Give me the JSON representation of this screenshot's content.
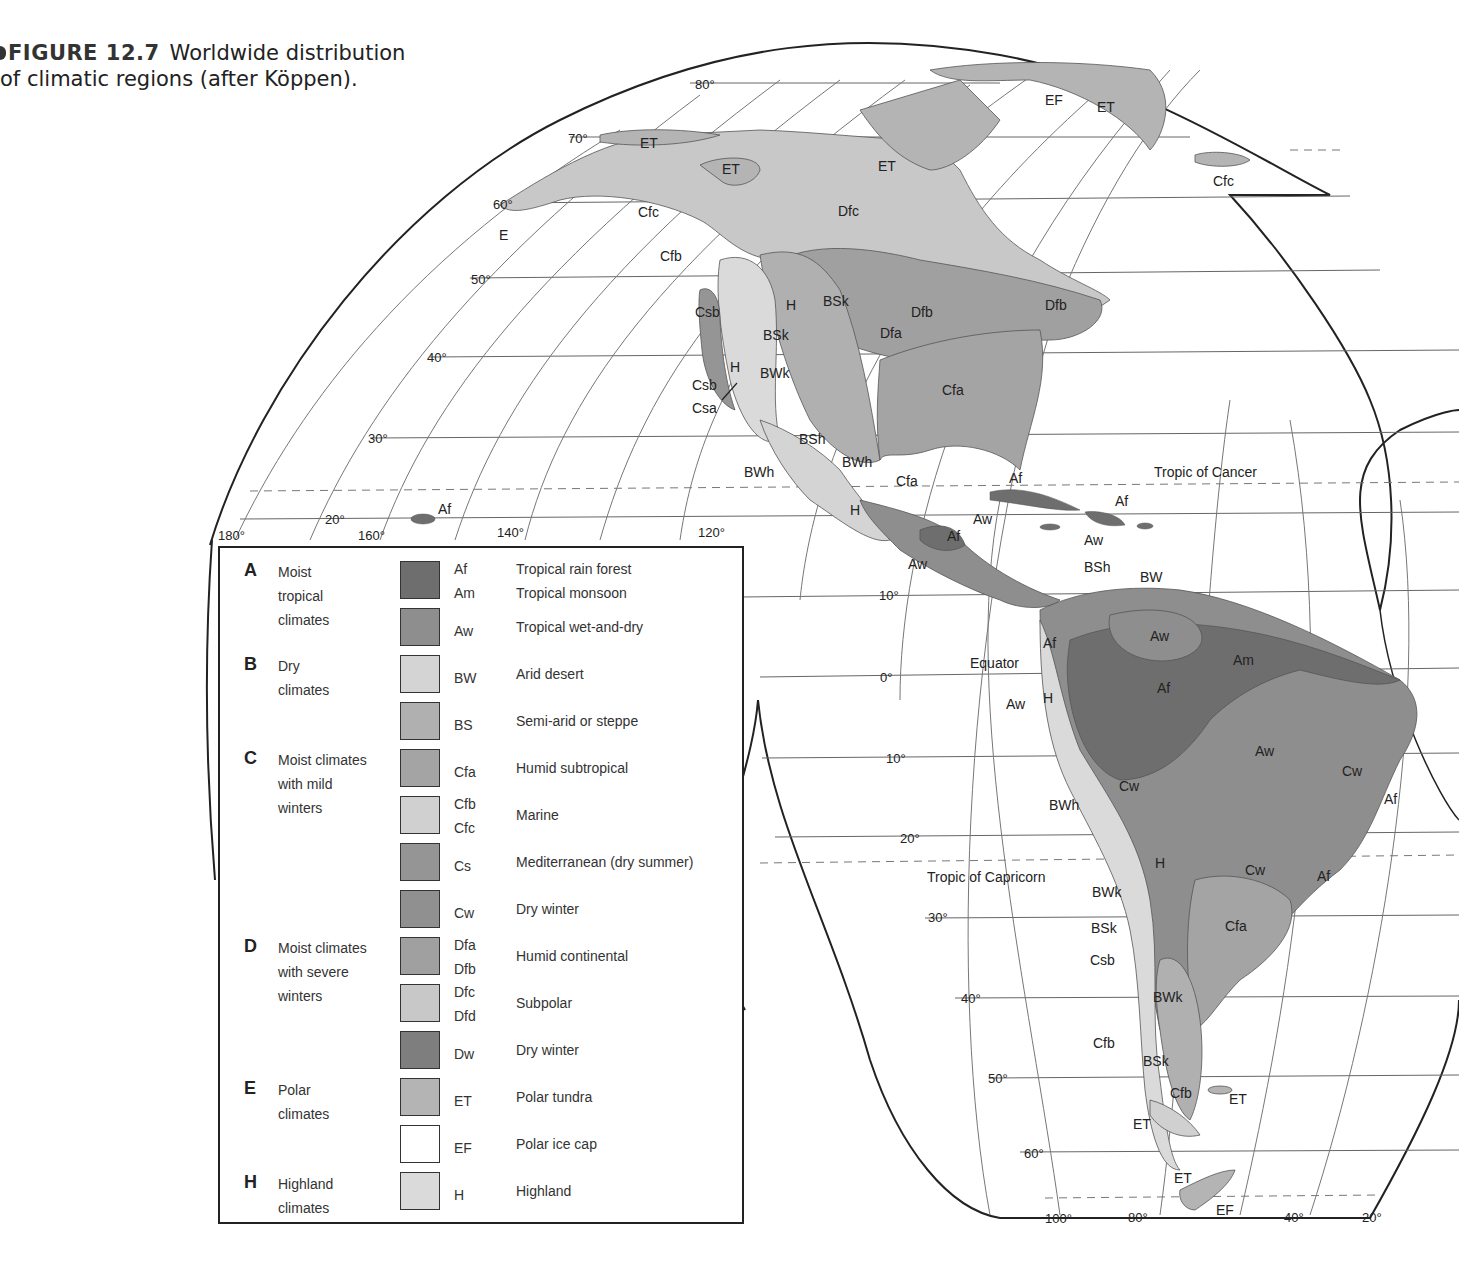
{
  "caption": {
    "figure_label": "FIGURE 12.7",
    "text_line1": "Worldwide distribution",
    "text_line2": "of climatic regions (after Köppen)."
  },
  "map": {
    "latitude_labels": [
      "80°",
      "70°",
      "60°",
      "50°",
      "40°",
      "30°",
      "20°",
      "10°",
      "0°",
      "10°",
      "20°",
      "30°",
      "40°",
      "50°",
      "60°"
    ],
    "longitude_labels_top": [
      "180°",
      "160°",
      "140°",
      "120°"
    ],
    "longitude_labels_bottom": [
      "100°",
      "80°",
      "40°",
      "20°"
    ],
    "reference_lines": {
      "tropic_cancer": "Tropic of Cancer",
      "equator": "Equator",
      "tropic_capricorn": "Tropic of Capricorn"
    },
    "region_labels": {
      "alaska_et": "ET",
      "canada_et1": "ET",
      "canada_et2": "ET",
      "greenland_ef": "EF",
      "greenland_et": "ET",
      "iceland_cfc": "Cfc",
      "alaska_cfc": "Cfc",
      "bc_cfb": "Cfb",
      "dfc": "Dfc",
      "e_aleut": "E",
      "csb1": "Csb",
      "h1": "H",
      "bsk1": "BSk",
      "h2": "H",
      "bsk2": "BSk",
      "bwk": "BWk",
      "csb2": "Csb",
      "csa": "Csa",
      "dfb1": "Dfb",
      "dfa": "Dfa",
      "dfb2": "Dfb",
      "cfa1": "Cfa",
      "bsh1": "BSh",
      "bwh1": "BWh",
      "bwh2": "BWh",
      "cfa2": "Cfa",
      "h3": "H",
      "hawaii_af": "Af",
      "af1": "Af",
      "af2": "Af",
      "aw1": "Aw",
      "af3": "Af",
      "aw2": "Aw",
      "aw3": "Aw",
      "bsh2": "BSh",
      "bw": "BW",
      "aw4": "Aw",
      "am": "Am",
      "af4": "Af",
      "af5": "Af",
      "aw5": "Aw",
      "h4": "H",
      "aw6": "Aw",
      "cw1": "Cw",
      "cw2": "Cw",
      "af6": "Af",
      "bwh3": "BWh",
      "h5": "H",
      "cw3": "Cw",
      "af7": "Af",
      "bwk2": "BWk",
      "bsk3": "BSk",
      "cfa3": "Cfa",
      "csb3": "Csb",
      "bwk3": "BWk",
      "cfb2": "Cfb",
      "bsk4": "BSk",
      "cfb3": "Cfb",
      "et_falk": "ET",
      "et_tdf": "ET",
      "et_ant": "ET",
      "ef_ant": "EF"
    }
  },
  "legend": {
    "groups": [
      {
        "letter": "A",
        "lines": [
          "Moist",
          "tropical",
          "climates"
        ]
      },
      {
        "letter": "B",
        "lines": [
          "Dry",
          "climates"
        ]
      },
      {
        "letter": "C",
        "lines": [
          "Moist climates",
          "with mild",
          "winters"
        ]
      },
      {
        "letter": "D",
        "lines": [
          "Moist climates",
          "with severe",
          "winters"
        ]
      },
      {
        "letter": "E",
        "lines": [
          "Polar",
          "climates"
        ]
      },
      {
        "letter": "H",
        "lines": [
          "Highland",
          "climates"
        ]
      }
    ],
    "rows": [
      {
        "codes": [
          "Af",
          "Am"
        ],
        "descs": [
          "Tropical rain forest",
          "Tropical monsoon"
        ],
        "color": "#6e6e6e"
      },
      {
        "codes": [
          "Aw"
        ],
        "descs": [
          "Tropical wet-and-dry"
        ],
        "color": "#8e8e8e"
      },
      {
        "codes": [
          "BW"
        ],
        "descs": [
          "Arid desert"
        ],
        "color": "#d4d4d4"
      },
      {
        "codes": [
          "BS"
        ],
        "descs": [
          "Semi-arid or steppe"
        ],
        "color": "#b0b0b0"
      },
      {
        "codes": [
          "Cfa"
        ],
        "descs": [
          "Humid subtropical"
        ],
        "color": "#a4a4a4"
      },
      {
        "codes": [
          "Cfb",
          "Cfc"
        ],
        "descs": [
          "Marine"
        ],
        "color": "#d0d0d0"
      },
      {
        "codes": [
          "Cs"
        ],
        "descs": [
          "Mediterranean (dry summer)"
        ],
        "color": "#959595"
      },
      {
        "codes": [
          "Cw"
        ],
        "descs": [
          "Dry winter"
        ],
        "color": "#909090"
      },
      {
        "codes": [
          "Dfa",
          "Dfb"
        ],
        "descs": [
          "Humid continental"
        ],
        "color": "#a0a0a0"
      },
      {
        "codes": [
          "Dfc",
          "Dfd"
        ],
        "descs": [
          "Subpolar"
        ],
        "color": "#c8c8c8"
      },
      {
        "codes": [
          "Dw"
        ],
        "descs": [
          "Dry winter"
        ],
        "color": "#7e7e7e"
      },
      {
        "codes": [
          "ET"
        ],
        "descs": [
          "Polar tundra"
        ],
        "color": "#b4b4b4"
      },
      {
        "codes": [
          "EF"
        ],
        "descs": [
          "Polar ice cap"
        ],
        "color": "#ffffff"
      },
      {
        "codes": [
          "H"
        ],
        "descs": [
          "Highland"
        ],
        "color": "#dadada"
      }
    ]
  }
}
